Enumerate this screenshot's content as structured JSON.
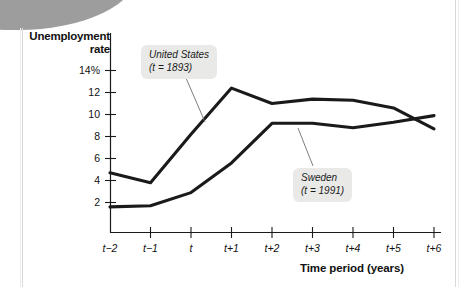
{
  "figure": {
    "y_axis_title_line1": "Unemployment",
    "y_axis_title_line2": "rate",
    "x_axis_title": "Time period (years)"
  },
  "callouts": {
    "united_states": {
      "name": "United States",
      "period": "(t = 1893)"
    },
    "sweden": {
      "name": "Sweden",
      "period": "(t = 1991)"
    }
  },
  "chart_data": {
    "type": "line",
    "title": "",
    "xlabel": "Time period (years)",
    "ylabel": "Unemployment rate",
    "categories": [
      "t-2",
      "t-1",
      "t",
      "t+1",
      "t+2",
      "t+3",
      "t+4",
      "t+5",
      "t+6"
    ],
    "xtick_labels": [
      "t−2",
      "t−1",
      "t",
      "t+1",
      "t+2",
      "t+3",
      "t+4",
      "t+5",
      "t+6"
    ],
    "ytick_labels": [
      "14%",
      "12",
      "10",
      "8",
      "6",
      "4",
      "2"
    ],
    "ytick_values": [
      14,
      12,
      10,
      8,
      6,
      4,
      2
    ],
    "ylim": [
      0,
      15
    ],
    "grid": false,
    "legend": "annotated-callouts",
    "series": [
      {
        "name": "United States",
        "annotation": "United States (t = 1893)",
        "color": "#1a1a1a",
        "values": [
          4.7,
          3.8,
          8.2,
          12.4,
          11.0,
          11.4,
          11.3,
          10.6,
          8.7
        ]
      },
      {
        "name": "Sweden",
        "annotation": "Sweden (t = 1991)",
        "color": "#1a1a1a",
        "values": [
          1.6,
          1.7,
          2.9,
          5.6,
          9.2,
          9.2,
          8.8,
          9.3,
          9.9
        ]
      }
    ]
  }
}
